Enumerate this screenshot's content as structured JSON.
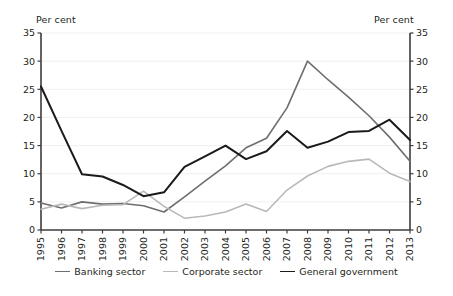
{
  "axis_titles": {
    "left": "Per cent",
    "right": "Per cent"
  },
  "colors": {
    "banking": "#6e6e6e",
    "corporate": "#b9b9b9",
    "government": "#1a1a1a",
    "axis": "#3d3d3d",
    "grid": "#f0f0f0",
    "text": "#231f20"
  },
  "legend": {
    "items": [
      {
        "label": "Banking sector",
        "color": "#6e6e6e"
      },
      {
        "label": "Corporate sector",
        "color": "#b9b9b9"
      },
      {
        "label": "General government",
        "color": "#1a1a1a"
      }
    ]
  },
  "chart_data": {
    "type": "line",
    "title": "",
    "subtitle": "",
    "xlabel": "",
    "ylabel": "Per cent",
    "ylabel_right": "Per cent",
    "ylim": [
      0,
      35
    ],
    "yticks": [
      0,
      5,
      10,
      15,
      20,
      25,
      30,
      35
    ],
    "ytick_labels": [
      "0",
      "5",
      "10",
      "15",
      "20",
      "25",
      "30",
      "35"
    ],
    "grid": true,
    "legend_position": "bottom",
    "dual_axis": true,
    "categories": [
      "1995",
      "1996",
      "1997",
      "1998",
      "1999",
      "2000",
      "2001",
      "2002",
      "2003",
      "2004",
      "2005",
      "2006",
      "2007",
      "2008",
      "2009",
      "2010",
      "2011",
      "2012",
      "2013"
    ],
    "series": [
      {
        "name": "Banking sector",
        "color": "#6e6e6e",
        "values": [
          4.8,
          3.9,
          5.0,
          4.6,
          4.7,
          4.3,
          3.2,
          5.9,
          8.7,
          11.4,
          14.6,
          16.3,
          21.7,
          30.0,
          26.7,
          23.6,
          20.3,
          16.5,
          12.2
        ]
      },
      {
        "name": "Corporate sector",
        "color": "#b9b9b9",
        "values": [
          3.7,
          4.6,
          3.8,
          4.4,
          4.5,
          6.9,
          4.2,
          2.1,
          2.5,
          3.2,
          4.6,
          3.3,
          7.1,
          9.6,
          11.3,
          12.2,
          12.6,
          10.1,
          8.6
        ]
      },
      {
        "name": "General government",
        "color": "#1a1a1a",
        "values": [
          25.5,
          17.6,
          9.9,
          9.5,
          8.0,
          6.0,
          6.7,
          11.2,
          13.1,
          15.0,
          12.6,
          14.0,
          17.6,
          14.6,
          15.7,
          17.4,
          17.6,
          19.6,
          16.0
        ]
      }
    ]
  }
}
